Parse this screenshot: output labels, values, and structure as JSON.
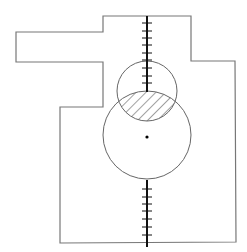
{
  "diagram": {
    "width": 247,
    "height": 252,
    "colors": {
      "background": "#ffffff",
      "outline": "#777777",
      "circle": "#666666",
      "axis": "#111111",
      "hatch": "#444444",
      "dot": "#000000"
    },
    "outline_points": "103,16 191,16 191,61 235,61 236,242 60,243 60,107 103,107 103,62 16,62 16,32 103,32",
    "axis": {
      "x": 147,
      "upper": {
        "y1": 16,
        "y2": 92
      },
      "lower": {
        "y1": 180,
        "y2": 247
      }
    },
    "ticks_upper_y": [
      23,
      31,
      38,
      45,
      53,
      60,
      68,
      76,
      83
    ],
    "ticks_lower_y": [
      189,
      197,
      204,
      211,
      219,
      227,
      235
    ],
    "tick_half_width": 5,
    "small_circle": {
      "cx": 147,
      "cy": 91,
      "r": 30
    },
    "large_circle": {
      "cx": 147,
      "cy": 135,
      "r": 44
    },
    "center_dot": {
      "cx": 147,
      "cy": 137,
      "r": 1.6
    }
  }
}
